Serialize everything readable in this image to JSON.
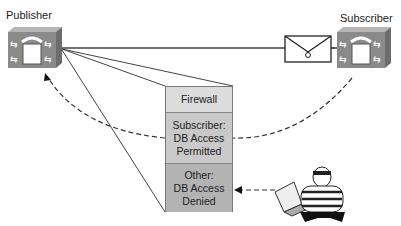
{
  "diagram": {
    "nodes": {
      "publisher": {
        "label": "Publisher",
        "icon": "ip-phone-server-icon"
      },
      "subscriber": {
        "label": "Subscriber",
        "icon": "ip-phone-server-icon"
      },
      "message": {
        "icon": "envelope-icon"
      },
      "attacker": {
        "icon": "burglar-with-laptop-icon"
      }
    },
    "firewall": {
      "sections": [
        {
          "label": "Firewall"
        },
        {
          "label": "Subscriber:\nDB Access\nPermitted"
        },
        {
          "label": "Other:\nDB Access\nDenied"
        }
      ]
    },
    "colors": {
      "device": "#8a8a8a",
      "line": "#333333",
      "fw_top": "#dcdcdc",
      "fw_mid": "#c9c9c9",
      "fw_bottom": "#b3b3b3"
    }
  }
}
